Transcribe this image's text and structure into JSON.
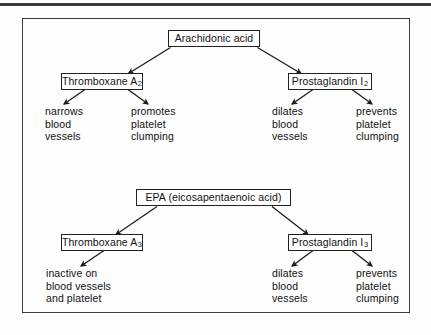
{
  "diagram": {
    "top_rule_color": "#3a3a3a",
    "frame_color": "#3c3c3c",
    "box_border_color": "#222222",
    "text_color": "#111111"
  },
  "upper_pathway": {
    "source": {
      "label": "Arachidonic acid",
      "text": "Arachidonic acid"
    },
    "left_product": {
      "name": "Thromboxane A2",
      "base": "Thromboxane A",
      "subscript": "2"
    },
    "right_product": {
      "name": "Prostaglandin I2",
      "base": "Prostaglandin I",
      "subscript": "2"
    },
    "effects": [
      {
        "id": "tx-a2-effect-1",
        "text": "narrows\nblood\nvessels"
      },
      {
        "id": "tx-a2-effect-2",
        "text": "promotes\nplatelet\nclumping"
      },
      {
        "id": "pgi2-effect-1",
        "text": "dilates\nblood\nvessels"
      },
      {
        "id": "pgi2-effect-2",
        "text": "prevents\nplatelet\nclumping"
      }
    ]
  },
  "lower_pathway": {
    "source": {
      "label": "EPA (eicosapentaenoic acid)",
      "text": "EPA (eicosapentaenoic acid)"
    },
    "left_product": {
      "name": "Thromboxane A3",
      "base": "Thromboxane A",
      "subscript": "3"
    },
    "right_product": {
      "name": "Prostaglandin I3",
      "base": "Prostaglandin I",
      "subscript": "3"
    },
    "effects": [
      {
        "id": "tx-a3-effect-1",
        "text": "inactive on\nblood vessels\nand platelet"
      },
      {
        "id": "pgi3-effect-1",
        "text": "dilates\nblood\nvessels"
      },
      {
        "id": "pgi3-effect-2",
        "text": "prevents\nplatelet\nclumping"
      }
    ]
  }
}
